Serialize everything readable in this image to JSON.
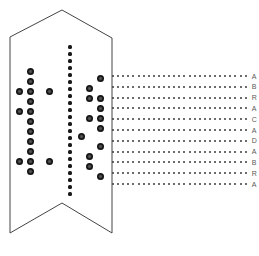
{
  "figure": {
    "title": "",
    "caption": "",
    "background_color": "#ffffff",
    "outline_color": "#444444",
    "dot_color": "#1a1a1a",
    "grid_dot_color": "#3a3a3a",
    "letter_color": "#5a5a5a",
    "width": 259,
    "height": 256
  },
  "banner": {
    "name": "banner-outline",
    "description": "pennant shape with chevron top point and notched swallowtail bottom",
    "points": "10,37 62,10 112,38 112,233 62,203 10,233"
  },
  "chart_data": {
    "type": "scatter",
    "title": "",
    "xlabel": "",
    "ylabel": "",
    "grid": false,
    "legend_position": "none",
    "annotations": [
      "A",
      "B",
      "R",
      "A",
      "C",
      "A",
      "D",
      "A",
      "B",
      "R",
      "A"
    ],
    "annotation_word": "ABRACADABRA",
    "series": [
      {
        "name": "left-cluster",
        "marker": "large-dot",
        "points": [
          [
            30,
            71
          ],
          [
            30,
            81
          ],
          [
            19,
            91
          ],
          [
            30,
            91
          ],
          [
            30,
            101
          ],
          [
            19,
            111
          ],
          [
            30,
            111
          ],
          [
            30,
            121
          ],
          [
            30,
            131
          ],
          [
            30,
            141
          ],
          [
            30,
            151
          ],
          [
            19,
            161
          ],
          [
            30,
            161
          ],
          [
            30,
            171
          ]
        ]
      },
      {
        "name": "left-outer",
        "marker": "large-dot",
        "points": [
          [
            49,
            91
          ],
          [
            49,
            161
          ]
        ]
      },
      {
        "name": "center-column",
        "marker": "small-dot",
        "points": [
          [
            70,
            47
          ],
          [
            70,
            54
          ],
          [
            70,
            61
          ],
          [
            70,
            68
          ],
          [
            70,
            75
          ],
          [
            70,
            82
          ],
          [
            70,
            89
          ],
          [
            70,
            96
          ],
          [
            70,
            103
          ],
          [
            70,
            110
          ],
          [
            70,
            117
          ],
          [
            70,
            124
          ],
          [
            70,
            131
          ],
          [
            70,
            138
          ],
          [
            70,
            145
          ],
          [
            70,
            152
          ],
          [
            70,
            159
          ],
          [
            70,
            166
          ],
          [
            70,
            173
          ],
          [
            70,
            180
          ],
          [
            70,
            187
          ],
          [
            70,
            194
          ]
        ]
      },
      {
        "name": "right-cluster",
        "marker": "large-dot",
        "points": [
          [
            100,
            78
          ],
          [
            89,
            88
          ],
          [
            100,
            98
          ],
          [
            89,
            98
          ],
          [
            100,
            108
          ],
          [
            89,
            118
          ],
          [
            100,
            118
          ],
          [
            100,
            128
          ],
          [
            81,
            136
          ],
          [
            100,
            146
          ],
          [
            89,
            156
          ],
          [
            89,
            166
          ],
          [
            100,
            176
          ]
        ]
      }
    ],
    "grid_field": {
      "name": "dotted-grid",
      "rows": 11,
      "cols": 27,
      "x_start": 112,
      "x_step": 5.1,
      "y_start": 75,
      "y_step": 10.8,
      "row_labels": [
        "A",
        "B",
        "R",
        "A",
        "C",
        "A",
        "D",
        "A",
        "B",
        "R",
        "A"
      ]
    }
  }
}
